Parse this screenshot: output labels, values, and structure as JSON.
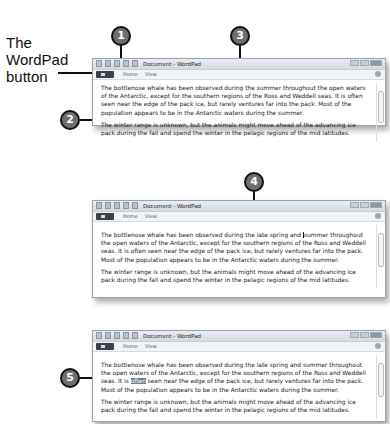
{
  "annotation": {
    "wordpad_button_label": "The WordPad button",
    "callouts": [
      "1",
      "2",
      "3",
      "4",
      "5"
    ]
  },
  "window": {
    "title": "Document - WordPad",
    "tabs": [
      "Home",
      "View"
    ]
  },
  "panels": [
    {
      "p1": "The bottlenose whale has been observed during the summer throughout the open waters of the Antarctic, except for the southern regions of the Ross and Weddell seas. It is often seen near the edge of the pack ice, but rarely ventures far into the pack. Most of the population appears to be in the Antarctic waters during the summer.",
      "p2": "The winter range is unknown, but the animals might move ahead of the advancing ice pack during the fall and spend the winter in the pelagic regions of the mid latitudes."
    },
    {
      "p1_a": "The bottlenose whale has been observed during the ",
      "p1_insert": "late spring and ",
      "p1_b": "summer throughout the open waters of the Antarctic, except for the southern regions of the Ross and Weddell seas. It is often seen near the edge of the pack ice, but rarely ventures far into the pack. Most of the population appears to be in the Antarctic waters during the summer.",
      "p2": "The winter range is unknown, but the animals might move ahead of the advancing ice pack during the fall and spend the winter in the pelagic regions of the mid latitudes."
    },
    {
      "p1_a": "The bottlenose whale has been observed during the late spring and summer throughout the open waters of the Antarctic, except for the southern regions of the Ross and Weddell seas. It is ",
      "p1_sel": "often",
      "p1_b": " seen near the edge of the pack ice, but rarely ventures far into the pack. Most of the population appears to be in the Antarctic waters during the summer.",
      "p2": "The winter range is unknown, but the animals might move ahead of the advancing ice pack during the fall and spend the winter in the pelagic regions of the mid latitudes."
    }
  ]
}
